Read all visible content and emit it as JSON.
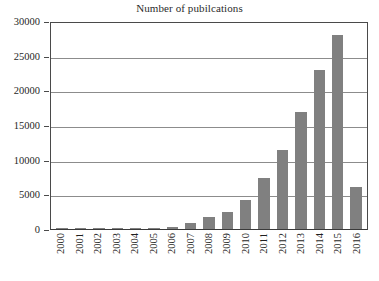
{
  "chart_data": {
    "type": "bar",
    "title": "Number of pubilcations",
    "xlabel": "",
    "ylabel": "",
    "categories": [
      "2000",
      "2001",
      "2002",
      "2003",
      "2004",
      "2005",
      "2006",
      "2007",
      "2008",
      "2009",
      "2010",
      "2011",
      "2012",
      "2013",
      "2014",
      "2015",
      "2016"
    ],
    "values": [
      30,
      40,
      50,
      45,
      60,
      70,
      300,
      850,
      1700,
      2500,
      4200,
      7350,
      11400,
      16900,
      22900,
      28000,
      6000
    ],
    "ylim": [
      0,
      30000
    ],
    "ytick_labels": [
      "30000",
      "25000",
      "20000",
      "15000",
      "10000",
      "5000",
      "0"
    ],
    "ytick_values": [
      30000,
      25000,
      20000,
      15000,
      10000,
      5000,
      0
    ],
    "grid": true,
    "legend": "none",
    "bar_color": "#808080",
    "axis_color": "#4a4a4a",
    "gridline_color": "#8c8c8c",
    "background_color": "#ffffff",
    "xtick_rotation": 90
  }
}
